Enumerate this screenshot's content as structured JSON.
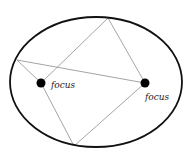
{
  "diagram": {
    "labels": {
      "left_focus": "focus",
      "right_focus": "focus"
    },
    "ellipse": {
      "cx": 96,
      "cy": 82,
      "rx": 86,
      "ry": 65,
      "stroke": "#111111",
      "stroke_width": 1.8
    },
    "foci": [
      {
        "name": "left",
        "x": 41,
        "y": 83,
        "r": 4.5
      },
      {
        "name": "right",
        "x": 145,
        "y": 83,
        "r": 4.5
      }
    ],
    "boundary_points": {
      "top": {
        "x": 108,
        "y": 18
      },
      "left": {
        "x": 17,
        "y": 60
      },
      "bottom": {
        "x": 74,
        "y": 146
      }
    },
    "colors": {
      "ray": "#999999",
      "outline": "#111111",
      "focus_dot": "#000000"
    }
  }
}
